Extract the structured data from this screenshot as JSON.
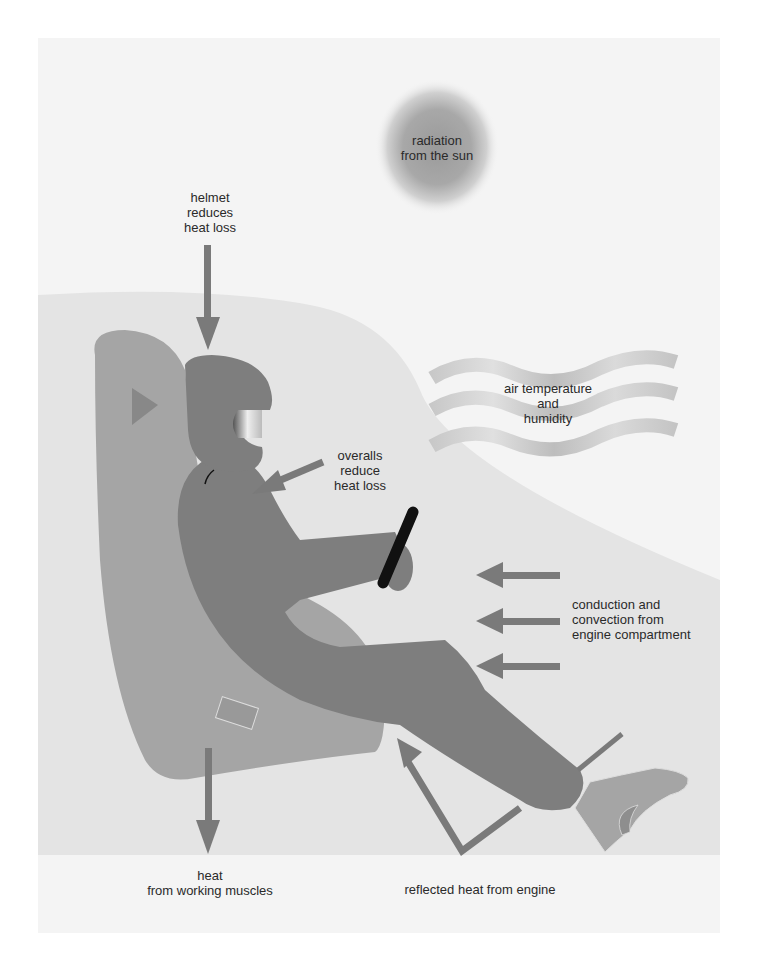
{
  "diagram": {
    "type": "illustration",
    "colors": {
      "outer_panel": "#f4f4f4",
      "inner_panel": "#e4e4e4",
      "seat": "#a5a5a5",
      "body": "#7e7e7e",
      "arrow": "#7a7a7a",
      "steering": "#111111",
      "text": "#2a2a2a"
    }
  },
  "labels": {
    "sun": {
      "line1": "radiation",
      "line2": "from the sun"
    },
    "helmet": {
      "line1": "helmet",
      "line2": "reduces",
      "line3": "heat loss"
    },
    "air": {
      "line1": "air temperature",
      "line2": "and",
      "line3": "humidity"
    },
    "overalls": {
      "line1": "overalls",
      "line2": "reduce",
      "line3": "heat loss"
    },
    "engine": {
      "line1": "conduction and",
      "line2": "convection from",
      "line3": "engine compartment"
    },
    "muscles": {
      "line1": "heat",
      "line2": "from working muscles"
    },
    "reflected": {
      "line1": "reflected heat from engine"
    }
  }
}
